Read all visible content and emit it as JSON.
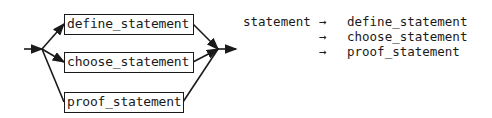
{
  "diagram": {
    "alternatives": [
      {
        "label": "define_statement"
      },
      {
        "label": "choose_statement"
      },
      {
        "label": "proof_statement"
      }
    ]
  },
  "grammar": {
    "lhs": "statement",
    "arrow": "→",
    "rules": [
      {
        "rhs": "define_statement"
      },
      {
        "rhs": "choose_statement"
      },
      {
        "rhs": "proof_statement"
      }
    ]
  }
}
